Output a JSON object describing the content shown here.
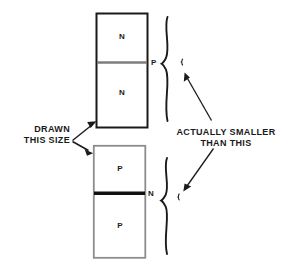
{
  "figure": {
    "type": "semiconductor-layer-diagram",
    "background_color": "#ffffff",
    "ink_color": "#1a1a1a",
    "gray_line_color": "#888888"
  },
  "devices": [
    {
      "id": "npn-stack",
      "name": "upper-device",
      "outline_color": "#1a1a1a",
      "regions": [
        {
          "label": "N",
          "position": "top"
        },
        {
          "label": "N",
          "position": "bottom"
        }
      ],
      "junction": {
        "label": "P",
        "color": "#808080",
        "thickness": "thin"
      }
    },
    {
      "id": "pnp-stack",
      "name": "lower-device",
      "outline_color": "#8a8a8a",
      "regions": [
        {
          "label": "P",
          "position": "top"
        },
        {
          "label": "P",
          "position": "bottom"
        }
      ],
      "junction": {
        "label": "N",
        "color": "#111111",
        "thickness": "thick"
      }
    }
  ],
  "annotations": {
    "left_callout": {
      "line1": "DRAWN",
      "line2": "THIS SIZE",
      "arrow_count": 2,
      "targets": [
        "upper-device",
        "lower-device"
      ]
    },
    "right_callout": {
      "line1": "ACTUALLY SMALLER",
      "line2": "THAN THIS",
      "arrow_count": 2,
      "targets": [
        "upper-scale-mark",
        "lower-scale-mark"
      ]
    }
  },
  "braces": [
    {
      "id": "upper-brace",
      "spans": "upper-device-height"
    },
    {
      "id": "lower-brace",
      "spans": "lower-device-height"
    }
  ],
  "scale_marks": [
    {
      "id": "upper-scale-mark",
      "meaning": "true-relative-size-of-upper-junction"
    },
    {
      "id": "lower-scale-mark",
      "meaning": "true-relative-size-of-lower-junction"
    }
  ]
}
